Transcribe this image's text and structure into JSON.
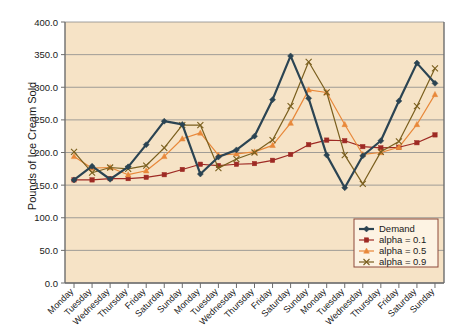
{
  "chart_data": {
    "type": "line",
    "title": "",
    "xlabel": "",
    "ylabel": "Pounds of Ice Cream Sold",
    "ylim": [
      0,
      400
    ],
    "ytick_values": [
      0,
      50,
      100,
      150,
      200,
      250,
      300,
      350,
      400
    ],
    "ytick_labels": [
      "0.0",
      "50.0",
      "100.0",
      "150.0",
      "200.0",
      "250.0",
      "300.0",
      "350.0",
      "400.0"
    ],
    "grid": true,
    "legend_position": "bottom-right",
    "categories": [
      "Monday",
      "Tuesday",
      "Wednesday",
      "Thursday",
      "Friday",
      "Saturday",
      "Sunday",
      "Monday",
      "Tuesday",
      "Wednesday",
      "Thursday",
      "Friday",
      "Saturday",
      "Sunday",
      "Monday",
      "Tuesday",
      "Wednesday",
      "Thursday",
      "Friday",
      "Saturday",
      "Sunday"
    ],
    "series": [
      {
        "name": "Demand",
        "color": "#2b4453",
        "marker": "diamond",
        "values": [
          158,
          179,
          159,
          178,
          212,
          248,
          243,
          167,
          193,
          204,
          225,
          281,
          348,
          283,
          196,
          146,
          195,
          218,
          279,
          337,
          306
        ]
      },
      {
        "name": "alpha = 0.1",
        "color": "#9e2a24",
        "marker": "square",
        "values": [
          158,
          158,
          160,
          160,
          162,
          166,
          174,
          182,
          180,
          182,
          183,
          188,
          197,
          212,
          219,
          218,
          209,
          207,
          208,
          215,
          227
        ]
      },
      {
        "name": "alpha = 0.5",
        "color": "#e8883a",
        "marker": "triangle",
        "values": [
          194,
          176,
          177,
          166,
          172,
          194,
          221,
          230,
          196,
          198,
          201,
          211,
          245,
          296,
          292,
          243,
          197,
          200,
          208,
          243,
          289
        ]
      },
      {
        "name": "alpha = 0.9",
        "color": "#7a5f1e",
        "marker": "cross",
        "values": [
          201,
          169,
          177,
          175,
          180,
          207,
          242,
          242,
          176,
          190,
          200,
          219,
          271,
          339,
          292,
          196,
          152,
          201,
          217,
          271,
          329
        ]
      }
    ]
  },
  "legend": {
    "items": [
      {
        "label": "Demand",
        "color": "#2b4453"
      },
      {
        "label": "alpha = 0.1",
        "color": "#9e2a24"
      },
      {
        "label": "alpha = 0.5",
        "color": "#e8883a"
      },
      {
        "label": "alpha = 0.9",
        "color": "#7a5f1e"
      }
    ]
  },
  "style": {
    "plot_background": "#f6e3c6",
    "grid_color": "#8a8a8a",
    "axis_color": "#6d6d6d",
    "text_color": "#1a1a1a",
    "legend_background": "#fdf3e3",
    "legend_border": "#8d4a3a"
  }
}
